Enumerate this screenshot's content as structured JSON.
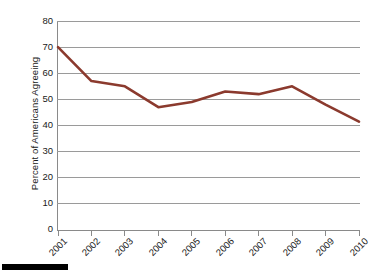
{
  "chart_data": {
    "type": "line",
    "title": "",
    "subtitle": "",
    "xlabel": "",
    "ylabel": "Percent of Americans Agreeing",
    "categories": [
      "2001",
      "2002",
      "2003",
      "2004",
      "2005",
      "2006",
      "2007",
      "2008",
      "2009",
      "2010"
    ],
    "values": [
      70,
      57,
      55,
      47,
      49,
      53,
      52,
      55,
      48,
      41.5
    ],
    "series": [
      {
        "name": "Percent of Americans Agreeing",
        "color": "#8B3A2E",
        "values": [
          70,
          57,
          55,
          47,
          49,
          53,
          52,
          55,
          48,
          41.5
        ]
      }
    ],
    "ylim": [
      0,
      80
    ],
    "ytick_labels": [
      "80",
      "70",
      "60",
      "50",
      "40",
      "30",
      "20",
      "10",
      "0"
    ],
    "ytick_values": [
      80,
      70,
      60,
      50,
      40,
      30,
      20,
      10,
      0
    ],
    "xtick_labels": [
      "2001",
      "2002",
      "2003",
      "2004",
      "2005",
      "2006",
      "2007",
      "2008",
      "2009",
      "2010"
    ],
    "grid": true,
    "grid_axis": "y",
    "legend": false,
    "legend_position": "none",
    "xtick_label_rotation": -45,
    "annotations": []
  },
  "figure": {
    "background_color": "#FFFFFF",
    "grid_color": "#9A9A9A",
    "axis_color": "#8A8A8A",
    "text_color": "#1A1A1A",
    "line_color": "#8B3A2E",
    "footer_bar_color": "#000000"
  }
}
